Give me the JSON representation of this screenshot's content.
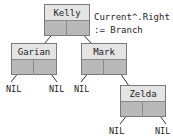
{
  "diagram": {
    "type": "binary-tree",
    "nodes": [
      {
        "id": "kelly",
        "name": "Kelly"
      },
      {
        "id": "garian",
        "name": "Garian"
      },
      {
        "id": "mark",
        "name": "Mark"
      },
      {
        "id": "zelda",
        "name": "Zelda"
      }
    ],
    "edges": [
      {
        "from": "kelly",
        "side": "left",
        "to": "garian"
      },
      {
        "from": "kelly",
        "side": "right",
        "to": "mark"
      },
      {
        "from": "garian",
        "side": "left",
        "to": "NIL"
      },
      {
        "from": "garian",
        "side": "right",
        "to": "NIL"
      },
      {
        "from": "mark",
        "side": "left",
        "to": "NIL"
      },
      {
        "from": "mark",
        "side": "right",
        "to": "zelda"
      },
      {
        "from": "zelda",
        "side": "left",
        "to": "NIL"
      },
      {
        "from": "zelda",
        "side": "right",
        "to": "NIL"
      }
    ],
    "nil_label": "NIL",
    "annotation": {
      "line1": "Current^.Right",
      "line2": ":= Branch"
    },
    "colors": {
      "name_cell": "#e4e4e4",
      "pointer_cell": "#b9b9b9",
      "border": "#7a7a7a",
      "line": "#333333"
    }
  }
}
